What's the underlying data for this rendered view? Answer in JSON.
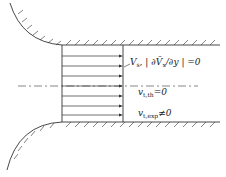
{
  "diagram": {
    "labels": {
      "vs": {
        "main": "V",
        "sub": "s",
        "rest": ", | ∂V̄",
        "sub2": "x",
        "tail": "/∂y | =0"
      },
      "vt_th": {
        "main": "v",
        "sub": "t,th",
        "tail": "=0"
      },
      "vt_exp": {
        "main": "v",
        "sub": "t,exp",
        "tail": "≠0"
      }
    },
    "colors": {
      "line": "#333333",
      "background": "#ffffff"
    }
  }
}
